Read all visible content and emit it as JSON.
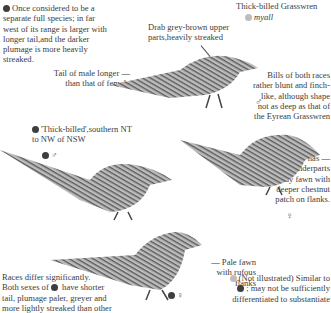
{
  "header": {
    "species_name": "Thick-billed Grasswren",
    "subspecies": "myall"
  },
  "notes": {
    "separate_species": "Once considered to be a separate full species; in far west of its range is larger with longer tail,and the darker plumage is more heavily streaked.",
    "drab_upper": "Drab grey-brown upper parts,heavily streaked",
    "tail_male": "Tail of male longer — than that of female",
    "bills": "Bills of both races rather blunt and finch-like, although shape not as deep as that of the Eyrean Grasswren",
    "female_underparts": "Female has — underparts sandy fawn with deeper chestnut patch on flanks.",
    "thick_billed_range": "'Thick-billed',southern NT to NW of NSW",
    "pale_fawn": "— Pale fawn with rufous flanks",
    "races_differ_1": "Races differ significantly.",
    "races_differ_2a": "Both sexes of",
    "races_differ_2b": "have shorter",
    "races_differ_3": "tail, plumage paler, greyer and",
    "races_differ_4": "more lightly streaked than other",
    "not_illustrated_1": "(Not illustrated) Similar to",
    "not_illustrated_2": "; may not be sufficiently",
    "not_illustrated_3": "differentiated to substantiate"
  },
  "symbols": {
    "male": "♂",
    "female": "♀"
  },
  "legend_colors": {
    "dark_race": "#3e3e3e",
    "light_race": "#bdbdbd"
  }
}
